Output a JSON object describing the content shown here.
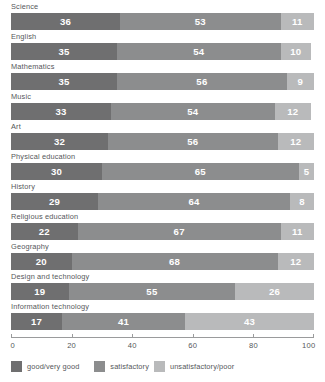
{
  "chart_data": {
    "type": "bar",
    "orientation": "horizontal",
    "stacked": true,
    "title": "",
    "xlabel": "",
    "ylabel": "",
    "xlim": [
      0,
      100
    ],
    "xticks": [
      0,
      20,
      40,
      60,
      80,
      100
    ],
    "grid": false,
    "legend_position": "bottom",
    "categories": [
      "Science",
      "English",
      "Mathematics",
      "Music",
      "Art",
      "Physical education",
      "History",
      "Religious education",
      "Geography",
      "Design and technology",
      "Information technology"
    ],
    "series": [
      {
        "name": "good/very good",
        "color": "#6f6f70",
        "values": [
          36,
          35,
          35,
          33,
          32,
          30,
          29,
          22,
          20,
          19,
          17
        ]
      },
      {
        "name": "satisfactory",
        "color": "#8c8d8e",
        "values": [
          53,
          54,
          56,
          54,
          56,
          65,
          64,
          67,
          68,
          55,
          41
        ]
      },
      {
        "name": "unsatisfactory/poor",
        "color": "#b9babb",
        "values": [
          11,
          10,
          9,
          12,
          12,
          5,
          8,
          11,
          12,
          26,
          43
        ]
      }
    ]
  }
}
